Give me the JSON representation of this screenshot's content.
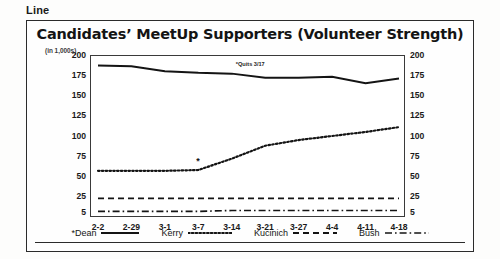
{
  "caption": "Line",
  "header": {
    "title": "Candidates’ MeetUp Supporters (Volunteer Strength)",
    "units": "(in 1,000s)"
  },
  "annotation": {
    "dean_quits": "*Quits 3/17",
    "kerry_star": "*"
  },
  "legend": {
    "items": [
      {
        "label": "*Dean",
        "style": "solid",
        "icon": "solid-line-icon"
      },
      {
        "label": "Kerry",
        "style": "dotted",
        "icon": "dotted-line-icon"
      },
      {
        "label": "Kucinich",
        "style": "dashed",
        "icon": "dashed-line-icon"
      },
      {
        "label": "Bush",
        "style": "dashdot",
        "icon": "dashdot-line-icon"
      }
    ]
  },
  "chart_data": {
    "type": "line",
    "title": "Candidates’ MeetUp Supporters (Volunteer Strength)",
    "subtitle": "(in 1,000s)",
    "xlabel": "",
    "ylabel": "(in 1,000s)",
    "grid": false,
    "legend_position": "bottom",
    "ylim": [
      0,
      200
    ],
    "yticks": [
      200,
      175,
      150,
      125,
      100,
      75,
      50,
      25,
      5
    ],
    "yticks_right": [
      200,
      175,
      150,
      125,
      100,
      75,
      50,
      25,
      5
    ],
    "categories": [
      "2-2",
      "2-29",
      "3-1",
      "3-7",
      "3-14",
      "3-21",
      "3-27",
      "4-4",
      "4-11",
      "4-18"
    ],
    "series": [
      {
        "name": "*Dean",
        "style": "solid",
        "values": [
          187,
          186,
          180,
          178,
          177,
          172,
          172,
          173,
          165,
          171
        ]
      },
      {
        "name": "Kerry",
        "style": "dotted",
        "values": [
          57,
          57,
          57,
          58,
          72,
          88,
          95,
          100,
          105,
          111
        ]
      },
      {
        "name": "Kucinich",
        "style": "dashed",
        "values": [
          23,
          23,
          23,
          23,
          23,
          23,
          23,
          23,
          23,
          23
        ]
      },
      {
        "name": "Bush",
        "style": "dashdot",
        "values": [
          7,
          7,
          7,
          7,
          8,
          8,
          8,
          8,
          8,
          8
        ]
      }
    ],
    "annotations": [
      {
        "text": "*Quits 3/17",
        "series": "*Dean",
        "near_x": "3-14"
      },
      {
        "text": "*",
        "series": "Kerry",
        "near_x": "3-7"
      }
    ]
  }
}
